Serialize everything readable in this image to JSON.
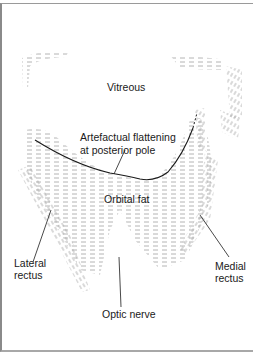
{
  "diagram": {
    "labels": {
      "vitreous": "Vitreous",
      "flattening_line1": "Artefactual flattening",
      "flattening_line2": "at posterior pole",
      "orbital_fat": "Orbital fat",
      "lateral_rectus_line1": "Lateral",
      "lateral_rectus_line2": "rectus",
      "medial_rectus_line1": "Medial",
      "medial_rectus_line2": "rectus",
      "optic_nerve": "Optic nerve"
    },
    "colors": {
      "background": "#ffffff",
      "ink": "#1a1a1a",
      "hatching": "#9a9a9a",
      "frame": "#8a8a8a"
    }
  }
}
